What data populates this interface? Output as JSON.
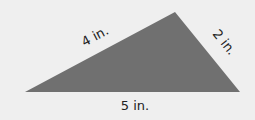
{
  "figure": {
    "type": "triangle",
    "fill_color": "#707070",
    "background_color": "#efefef",
    "sides": [
      {
        "id": "left",
        "label": "4 in."
      },
      {
        "id": "right",
        "label": "2 in."
      },
      {
        "id": "bottom",
        "label": "5 in."
      }
    ]
  }
}
